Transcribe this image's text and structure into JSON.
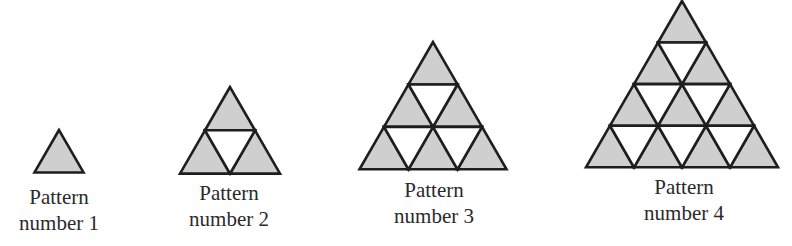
{
  "figure": {
    "fill_color": "#cfcfcf",
    "empty_color": "#ffffff",
    "stroke_color": "#1e1e1e",
    "patterns": [
      {
        "number": 1,
        "line1": "Pattern",
        "line2": "number 1",
        "apex": [
          59,
          130
        ],
        "side": 49,
        "rows": 1,
        "label_x": 59,
        "label_y": 184
      },
      {
        "number": 2,
        "line1": "Pattern",
        "line2": "number 2",
        "apex": [
          230,
          87
        ],
        "side": 100,
        "rows": 2,
        "label_x": 229,
        "label_y": 180
      },
      {
        "number": 3,
        "line1": "Pattern",
        "line2": "number 3",
        "apex": [
          433,
          42
        ],
        "side": 147,
        "rows": 3,
        "label_x": 434,
        "label_y": 177
      },
      {
        "number": 4,
        "line1": "Pattern",
        "line2": "number 4",
        "apex": [
          682,
          1
        ],
        "side": 192,
        "rows": 4,
        "label_x": 684,
        "label_y": 174
      }
    ]
  }
}
